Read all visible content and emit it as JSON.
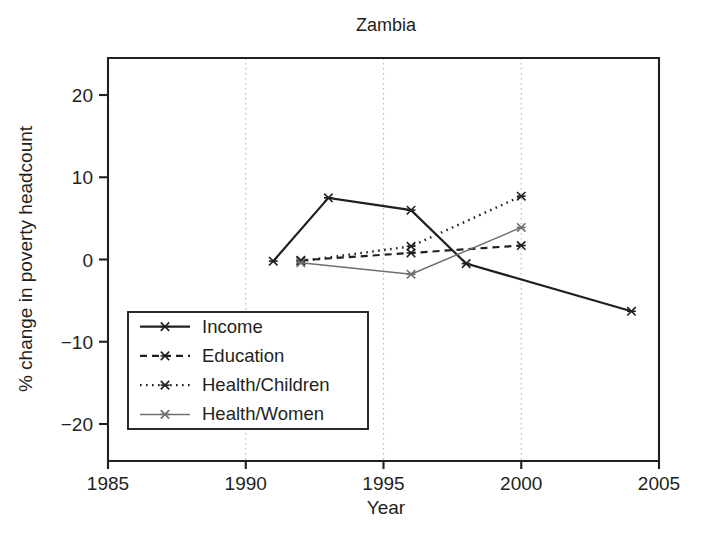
{
  "chart_data": {
    "type": "line",
    "title": "Zambia",
    "xlabel": "Year",
    "ylabel": "% change in poverty headcount",
    "xlim": [
      1985,
      2005
    ],
    "ylim": [
      -24.5,
      24.5
    ],
    "xticks": [
      1985,
      1990,
      1995,
      2000,
      2005
    ],
    "xtick_labels": [
      "1985",
      "1990",
      "1995",
      "2000",
      "2005"
    ],
    "yticks": [
      20,
      10,
      0,
      -10,
      -20
    ],
    "ytick_labels": [
      "20",
      "10",
      "0",
      "−10",
      "−20"
    ],
    "grid": "vertical dotted gridlines at 1990, 1995, 2000",
    "legend_position": "lower left inside axes",
    "series": [
      {
        "name": "Income",
        "style": "solid",
        "color": "#231f20",
        "width": 2.2,
        "dash": "none",
        "x": [
          1991,
          1993,
          1996,
          1998,
          2004
        ],
        "y": [
          -0.2,
          7.5,
          6.0,
          -0.5,
          -6.3
        ]
      },
      {
        "name": "Education",
        "style": "dashed",
        "color": "#231f20",
        "width": 2.2,
        "dash": "7 5",
        "x": [
          1992,
          1996,
          2000
        ],
        "y": [
          -0.1,
          0.8,
          1.7
        ]
      },
      {
        "name": "Health/Children",
        "style": "dotted",
        "color": "#231f20",
        "width": 2.4,
        "dash": "1.6 4.4",
        "x": [
          1992,
          1996,
          2000
        ],
        "y": [
          -0.2,
          1.6,
          7.7
        ]
      },
      {
        "name": "Health/Women",
        "style": "solid-thin",
        "color": "#6f6f6f",
        "width": 1.5,
        "dash": "none",
        "x": [
          1992,
          1996,
          2000
        ],
        "y": [
          -0.4,
          -1.8,
          3.9
        ]
      }
    ]
  },
  "legend": {
    "entries": [
      {
        "label": "Income",
        "dash": "none",
        "color": "#231f20",
        "width": 2.2
      },
      {
        "label": "Education",
        "dash": "7 5",
        "color": "#231f20",
        "width": 2.2
      },
      {
        "label": "Health/Children",
        "dash": "1.6 4.4",
        "color": "#231f20",
        "width": 2.4
      },
      {
        "label": "Health/Women",
        "dash": "none",
        "color": "#6f6f6f",
        "width": 1.5
      }
    ]
  },
  "plot_geometry": {
    "left": 108,
    "right": 659,
    "top": 58,
    "bottom": 461,
    "title_x": 386,
    "title_y": 22,
    "xlabel_x": 386,
    "xlabel_y": 514,
    "ylabel_x": 32,
    "ylabel_y": 259,
    "legend_x": 128,
    "legend_y": 312,
    "legend_w": 240,
    "legend_h": 117
  }
}
